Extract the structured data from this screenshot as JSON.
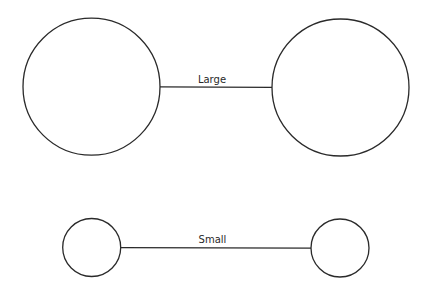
{
  "diagram": {
    "pairs": [
      {
        "label": "Large",
        "left_circle": {
          "cx": 91.5,
          "cy": 86.7,
          "r": 68.5
        },
        "right_circle": {
          "cx": 340.5,
          "cy": 87.5,
          "r": 68.5
        },
        "connector": {
          "x1": 160,
          "y1": 86.8,
          "x2": 272,
          "y2": 87.3
        },
        "label_pos": {
          "x": 212,
          "y": 83
        }
      },
      {
        "label": "Small",
        "left_circle": {
          "cx": 91.7,
          "cy": 247.5,
          "r": 29
        },
        "right_circle": {
          "cx": 340,
          "cy": 248,
          "r": 29
        },
        "connector": {
          "x1": 120.7,
          "y1": 247.6,
          "x2": 311,
          "y2": 248.2
        },
        "label_pos": {
          "x": 212.5,
          "y": 243
        }
      }
    ],
    "colors": {
      "stroke": "#2a2a2a",
      "background": "#ffffff"
    }
  }
}
